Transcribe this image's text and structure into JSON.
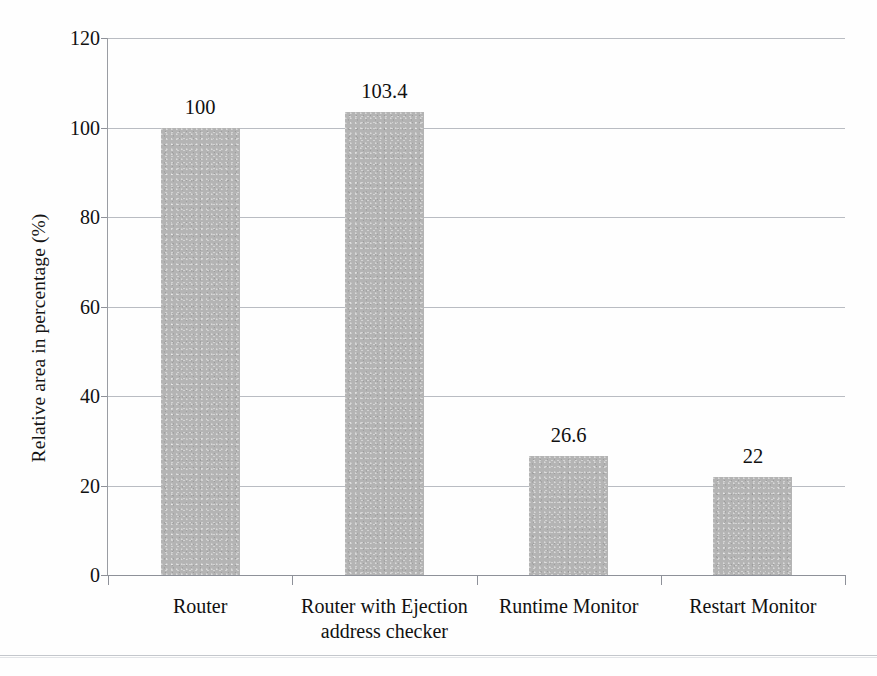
{
  "chart_data": {
    "type": "bar",
    "title": "",
    "xlabel": "",
    "ylabel": "Relative area in percentage (%)",
    "categories": [
      "Router",
      "Router with Ejection address checker",
      "Runtime Monitor",
      "Restart Monitor"
    ],
    "category_lines": [
      [
        "Router"
      ],
      [
        "Router with Ejection",
        "address checker"
      ],
      [
        "Runtime Monitor"
      ],
      [
        "Restart Monitor"
      ]
    ],
    "values": [
      100,
      103.4,
      26.6,
      22
    ],
    "value_labels": [
      "100",
      "103.4",
      "26.6",
      "22"
    ],
    "ylim": [
      0,
      120
    ],
    "y_ticks": [
      0,
      20,
      40,
      60,
      80,
      100,
      120
    ],
    "y_tick_labels": [
      "0",
      "20",
      "40",
      "60",
      "80",
      "100",
      "120"
    ],
    "grid": true,
    "grid_axis": "y",
    "legend": false,
    "legend_position": "none",
    "bar_color": "#b4b4b4",
    "axis_color": "#8e9199",
    "gridline_color": "#b9bcc2",
    "text_color": "#111111"
  }
}
